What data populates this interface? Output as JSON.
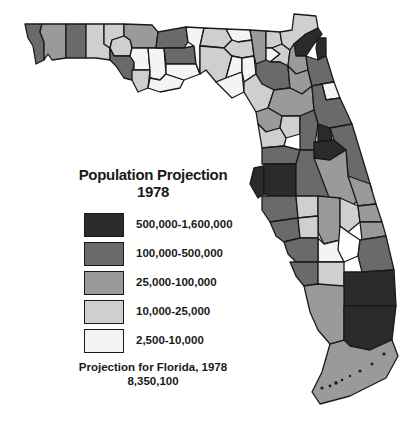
{
  "title": {
    "line1": "Population Projection",
    "line2": "1978"
  },
  "legend": {
    "items": [
      {
        "label": "500,000-1,600,000",
        "color": "#2b2b2b"
      },
      {
        "label": "100,000-500,000",
        "color": "#6a6a6a"
      },
      {
        "label": "25,000-100,000",
        "color": "#9a9a9a"
      },
      {
        "label": "10,000-25,000",
        "color": "#cfcfcf"
      },
      {
        "label": "2,500-10,000",
        "color": "#f4f4f4"
      }
    ]
  },
  "footnote": {
    "line1": "Projection for Florida, 1978",
    "line2": "8,350,100"
  },
  "map": {
    "region": "Florida",
    "unit": "county",
    "colors": {
      "c1": "#2b2b2b",
      "c2": "#6a6a6a",
      "c3": "#9a9a9a",
      "c4": "#cfcfcf",
      "c5": "#f4f4f4"
    }
  }
}
